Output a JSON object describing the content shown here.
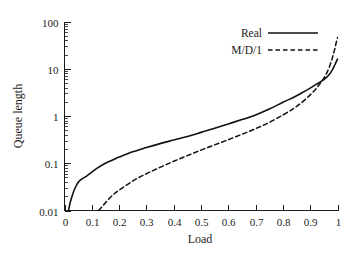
{
  "chart_data": {
    "type": "line",
    "title": "",
    "xlabel": "Load",
    "ylabel": "Queue length",
    "xlim": [
      0,
      1
    ],
    "ylim": [
      0.01,
      100
    ],
    "yscale": "log",
    "xscale": "linear",
    "grid": false,
    "legend_position": "top-right",
    "x_ticks": [
      "0",
      "0.1",
      "0.2",
      "0.3",
      "0.4",
      "0.5",
      "0.6",
      "0.7",
      "0.8",
      "0.9",
      "1"
    ],
    "x_tick_values": [
      0,
      0.1,
      0.2,
      0.3,
      0.4,
      0.5,
      0.6,
      0.7,
      0.8,
      0.9,
      1
    ],
    "y_ticks": [
      "0.01",
      "0.1",
      "1",
      "10",
      "100"
    ],
    "y_tick_values": [
      0.01,
      0.1,
      1,
      10,
      100
    ],
    "y_minor_ticks": [
      0.02,
      0.03,
      0.04,
      0.05,
      0.06,
      0.07,
      0.08,
      0.09,
      0.2,
      0.3,
      0.4,
      0.5,
      0.6,
      0.7,
      0.8,
      0.9,
      2,
      3,
      4,
      5,
      6,
      7,
      8,
      9,
      20,
      30,
      40,
      50,
      60,
      70,
      80,
      90
    ],
    "series": [
      {
        "name": "Real",
        "style": "solid",
        "color": "#111111",
        "x": [
          0.015,
          0.02,
          0.03,
          0.04,
          0.05,
          0.06,
          0.07,
          0.08,
          0.1,
          0.12,
          0.15,
          0.18,
          0.2,
          0.25,
          0.3,
          0.35,
          0.4,
          0.45,
          0.5,
          0.55,
          0.6,
          0.65,
          0.7,
          0.75,
          0.8,
          0.84,
          0.87,
          0.9,
          0.92,
          0.94,
          0.96,
          0.97,
          0.98,
          0.99,
          1.0
        ],
        "y": [
          0.01,
          0.014,
          0.022,
          0.031,
          0.039,
          0.045,
          0.049,
          0.053,
          0.065,
          0.079,
          0.1,
          0.12,
          0.135,
          0.175,
          0.215,
          0.26,
          0.31,
          0.37,
          0.45,
          0.55,
          0.68,
          0.84,
          1.05,
          1.4,
          1.95,
          2.5,
          3.1,
          3.9,
          4.6,
          5.4,
          6.6,
          7.6,
          9.2,
          12.0,
          16.0
        ]
      },
      {
        "name": "M/D/1",
        "style": "dashed",
        "color": "#111111",
        "x": [
          0.125,
          0.14,
          0.16,
          0.18,
          0.2,
          0.25,
          0.3,
          0.35,
          0.4,
          0.45,
          0.5,
          0.55,
          0.6,
          0.65,
          0.7,
          0.75,
          0.8,
          0.84,
          0.87,
          0.9,
          0.92,
          0.94,
          0.95,
          0.96,
          0.97,
          0.98,
          0.985,
          0.99,
          0.995,
          1.0
        ],
        "y": [
          0.01,
          0.0125,
          0.017,
          0.022,
          0.027,
          0.042,
          0.06,
          0.082,
          0.11,
          0.145,
          0.19,
          0.245,
          0.315,
          0.41,
          0.54,
          0.73,
          1.05,
          1.45,
          1.95,
          2.8,
          3.7,
          5.2,
          6.3,
          8.0,
          10.8,
          16.0,
          20.5,
          26.0,
          35.0,
          46.0
        ]
      }
    ]
  },
  "legend": {
    "entries": [
      {
        "label": "Real"
      },
      {
        "label": "M/D/1"
      }
    ]
  },
  "axes": {
    "x_title": "Load",
    "y_title": "Queue length"
  }
}
